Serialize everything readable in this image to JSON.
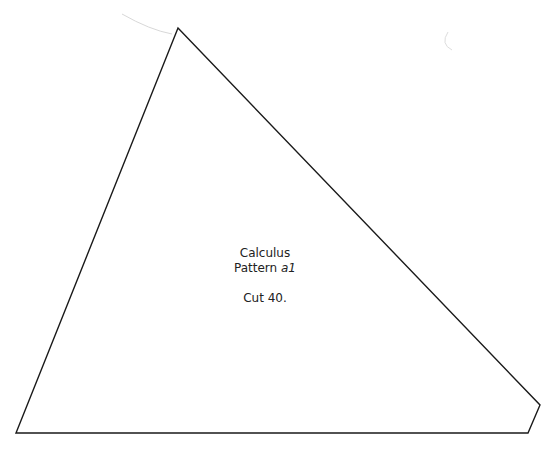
{
  "shape": {
    "type": "polygon",
    "stroke_color": "#1a1a1a",
    "fill_color": "#ffffff",
    "points": [
      [
        178,
        28
      ],
      [
        540,
        405
      ],
      [
        528,
        433
      ],
      [
        16,
        433
      ]
    ]
  },
  "artifacts": {
    "arc_top_left_color": "#d8d8d8",
    "arc_top_right_color": "#dddddd"
  },
  "label": {
    "title": "Calculus",
    "pattern_prefix": "Pattern",
    "pattern_id": "a1",
    "instruction": "Cut 40."
  }
}
